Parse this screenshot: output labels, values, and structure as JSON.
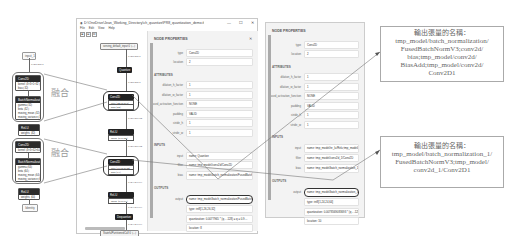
{
  "left_diagram": {
    "input_label": "input_1",
    "output_label": "Identity",
    "edge_label": "1×28×28×1",
    "fuse_label": "融合",
    "blocks": [
      {
        "conv": {
          "title": "Conv2D",
          "rows": [
            "kernel ⟨3×3×1×32⟩",
            "bias ⟨32⟩"
          ]
        },
        "bn": {
          "title": "BatchNormalization",
          "rows": [
            "gamma ⟨32⟩",
            "beta ⟨32⟩",
            "moving_mean ⟨32⟩",
            "moving_variance ⟨32⟩"
          ]
        },
        "act": {
          "title": "ReLU",
          "rows": [
            "weights ⟨32⟩"
          ]
        }
      },
      {
        "conv": {
          "title": "Conv2D",
          "rows": [
            "kernel ⟨3×3×32×64⟩"
          ]
        },
        "bn": {
          "title": "BatchNormalization",
          "rows": [
            "gamma ⟨64⟩",
            "beta ⟨64⟩",
            "moving_mean ⟨64⟩",
            "moving_variance ⟨64⟩"
          ]
        },
        "act": {
          "title": "ReLU",
          "rows": [
            "weights ⟨64⟩"
          ]
        }
      }
    ]
  },
  "window": {
    "title": "D:\\OneDrive\\Jean_Working_Directory\\ch_quantize\\PR8_quantization_demo.tflite - Netron",
    "controls": [
      "—",
      "☐",
      "✕"
    ],
    "menu": [
      "File",
      "Edit",
      "View",
      "Help"
    ],
    "toolbar": [
      "⊕",
      "⊖",
      "⊡"
    ],
    "graph": {
      "input": "serving_default_input:0 ⟨…⟩",
      "edge1": "1×28×28×1",
      "quantize": "Quantize",
      "edge2": "1×28×28×1",
      "conv1": {
        "title": "Conv2D",
        "rows": [
          "filter ⟨32×3×3×1⟩",
          "bias ⟨32⟩"
        ]
      },
      "edge3": "1×26×26×32",
      "relu1": {
        "title": "ReLU",
        "rows": [
          "alpha ⟨1×1×32⟩"
        ]
      },
      "edge4": "1×26×26×32",
      "conv2": {
        "title": "Conv2D",
        "rows": [
          "filter ⟨64×3×3×32⟩",
          "bias ⟨64⟩"
        ]
      },
      "edge5": "1×24×24×64",
      "relu2": {
        "title": "ReLU",
        "rows": [
          "alpha ⟨1×1×64⟩"
        ]
      },
      "edge6": "1×24×24×64",
      "dequantize": "Dequantize",
      "edge7": "1×24×24×64",
      "output": "StatefulPartitionedCall:0 ⟨…⟩"
    }
  },
  "panel1": {
    "title": "NODE PROPERTIES",
    "close": "✕",
    "type_label": "type",
    "type_value": "Conv2D",
    "location_label": "location",
    "location_value": "2",
    "attributes_title": "ATTRIBUTES",
    "attributes": [
      {
        "label": "dilation_h_factor",
        "value": "1"
      },
      {
        "label": "dilation_w_factor",
        "value": "1"
      },
      {
        "label": "fused_activation_function",
        "value": "NONE"
      },
      {
        "label": "padding",
        "value": "VALID"
      },
      {
        "label": "stride_h",
        "value": "1"
      },
      {
        "label": "stride_w",
        "value": "1"
      }
    ],
    "inputs_title": "INPUTS",
    "inputs": [
      {
        "label": "input",
        "value": "name: Quantize"
      },
      {
        "label": "filter",
        "value": "name: tmp_model/conv2d/Conv2D"
      },
      {
        "label": "bias",
        "value": "name: tmp_model/batch_normalization/FusedBatchNormV3"
      }
    ],
    "outputs_title": "OUTPUTS",
    "output": {
      "label": "output",
      "value": "name: tmp_model/batch_normalization/FusedBatchNormV3;…"
    },
    "extra_rows": [
      "type: int8[1,26,26,32]",
      "quantization: 0.0077965 * (q - -128) ≤ q ≤ 0.9…",
      "location: 8"
    ]
  },
  "panel2": {
    "title": "NODE PROPERTIES",
    "type_label": "type",
    "type_value": "Conv2D",
    "location_label": "location",
    "location_value": "2",
    "attributes_title": "ATTRIBUTES",
    "attributes": [
      {
        "label": "dilation_h_factor",
        "value": "1"
      },
      {
        "label": "dilation_w_factor",
        "value": "1"
      },
      {
        "label": "fused_activation_function",
        "value": "NONE"
      },
      {
        "label": "padding",
        "value": "VALID"
      },
      {
        "label": "stride_h",
        "value": "1"
      },
      {
        "label": "stride_w",
        "value": "1"
      }
    ],
    "inputs_title": "INPUTS",
    "inputs": [
      {
        "label": "input",
        "value": "name: tmp_model/re_lu/Relu;tmp_model/re_lu…"
      },
      {
        "label": "filter",
        "value": "name: tmp_model/conv2d_1/Conv2D"
      },
      {
        "label": "bias",
        "value": "name: tmp_model/batch_normalization_1/FusedBatchNormV3"
      }
    ],
    "outputs_title": "OUTPUTS",
    "output": {
      "label": "output",
      "value": "name: tmp_model/batch_normalization_1/Fuse…"
    },
    "extra_rows": [
      "type: int8[1,24,24,64]",
      "quantization: 0.0078569083693 * (q - -128) ≤ …",
      "location: 10"
    ]
  },
  "callouts": {
    "top": "輸出張量的名稱：\ntmp_model/batch_normalization/\nFusedBatchNormV3;conv2d/\nbias;tmp_model/conv2d/\nBiasAdd;tmp_model/conv2d/\nConv2D1",
    "bottom": "輸出張量的名稱：\ntmp_model/batch_normalization_1/\nFusedBatchNormV3;tmp_model/\nconv2d_1/Conv2D1"
  }
}
